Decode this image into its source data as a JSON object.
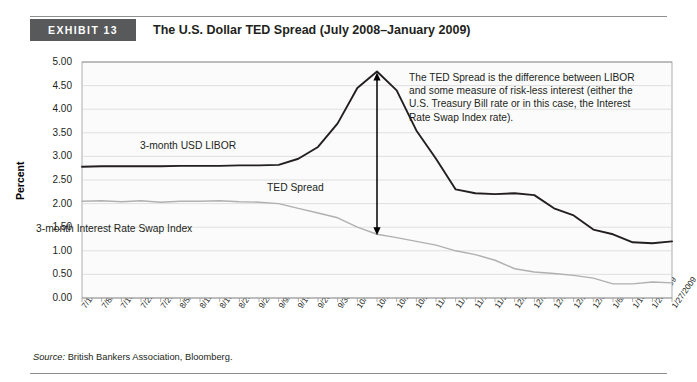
{
  "exhibit": {
    "badge_label": "EXHIBIT 13",
    "title": "The U.S. Dollar TED Spread (July 2008–January 2009)",
    "badge_color": "#58595b",
    "rule_color": "#8d8f91"
  },
  "source": {
    "prefix": "Source:",
    "text": " British Bankers Association, Bloomberg."
  },
  "annotation": {
    "text": "The TED Spread is the difference between LIBOR and some measure of risk-less interest (either the U.S. Treasury Bill rate or in this case, the Interest Rate Swap Index rate)."
  },
  "inline_labels": {
    "libor": "3-month USD LIBOR",
    "ted": "TED Spread",
    "swap": "3-month Interest Rate Swap Index"
  },
  "chart_data": {
    "type": "line",
    "title": "The U.S. Dollar TED Spread (July 2008–January 2009)",
    "xlabel": "",
    "ylabel": "Percent",
    "ylim": [
      0,
      5
    ],
    "ytick_step": 0.5,
    "ytick_labels": [
      "0.00",
      "0.50",
      "1.00",
      "1.50",
      "2.00",
      "2.50",
      "3.00",
      "3.50",
      "4.00",
      "4.50",
      "5.00"
    ],
    "grid": true,
    "legend": "none",
    "colors": {
      "libor": "#231f20",
      "swap": "#b0b0b0",
      "grid": "#d9d9d9",
      "axis": "#9a9a9a",
      "arrow": "#000000"
    },
    "categories": [
      "7/1/2008",
      "7/8/2008",
      "7/15/2008",
      "7/22/2008",
      "7/29/2008",
      "8/5/2008",
      "8/12/2008",
      "8/19/2008",
      "8/26/2008",
      "9/2/2008",
      "9/9/2008",
      "9/16/2008",
      "9/23/2008",
      "9/30/2008",
      "10/7/2008",
      "10/14/2008",
      "10/21/2008",
      "10/28/2008",
      "11/4/2008",
      "11/11/2008",
      "11/18/2008",
      "11/25/2008",
      "12/2/2008",
      "12/9/2008",
      "12/16/2008",
      "12/23/2008",
      "12/30/2008",
      "1/6/2009",
      "1/13/2009",
      "1/20/2009",
      "1/27/2009"
    ],
    "series": [
      {
        "name": "3-month USD LIBOR",
        "color": "#231f20",
        "values": [
          2.78,
          2.79,
          2.79,
          2.79,
          2.79,
          2.8,
          2.8,
          2.8,
          2.81,
          2.81,
          2.82,
          2.95,
          3.2,
          3.7,
          4.45,
          4.8,
          4.4,
          3.55,
          2.95,
          2.3,
          2.22,
          2.2,
          2.22,
          2.18,
          1.9,
          1.75,
          1.45,
          1.35,
          1.18,
          1.16,
          1.2
        ]
      },
      {
        "name": "3-month Interest Rate Swap Index",
        "color": "#b0b0b0",
        "values": [
          2.05,
          2.06,
          2.04,
          2.06,
          2.03,
          2.05,
          2.05,
          2.06,
          2.04,
          2.03,
          2.0,
          1.9,
          1.8,
          1.7,
          1.5,
          1.35,
          1.28,
          1.2,
          1.12,
          1.0,
          0.92,
          0.8,
          0.62,
          0.55,
          0.52,
          0.48,
          0.42,
          0.3,
          0.3,
          0.34,
          0.32
        ]
      }
    ],
    "annotations": [
      {
        "type": "double-headed-arrow",
        "label": "TED Spread",
        "x_category": "10/14/2008",
        "y_top": 4.78,
        "y_bottom": 1.33
      }
    ]
  }
}
